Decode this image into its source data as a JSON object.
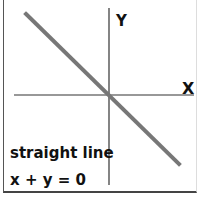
{
  "diagram": {
    "axis_labels": {
      "x": "X",
      "y": "Y"
    },
    "caption": "straight line",
    "equation": "x + y = 0",
    "colors": {
      "line": "#777777",
      "axes": "#333333",
      "text": "#111111"
    }
  }
}
